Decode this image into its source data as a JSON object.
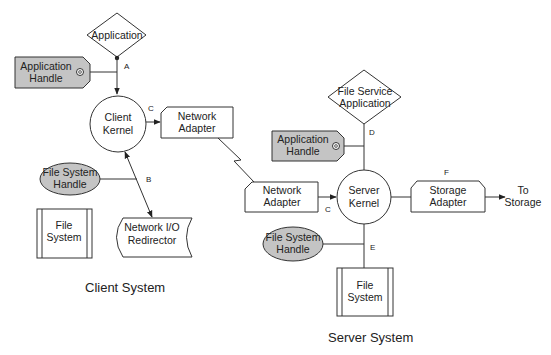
{
  "diagram": {
    "colors": {
      "line": "#333333",
      "handle_fill": "#c4c4c4",
      "background": "#ffffff"
    },
    "client": {
      "title": "Client System",
      "application": {
        "line1": "Application"
      },
      "app_handle": {
        "line1": "Application",
        "line2": "Handle"
      },
      "kernel": {
        "line1": "Client",
        "line2": "Kernel"
      },
      "network_adapter": {
        "line1": "Network",
        "line2": "Adapter"
      },
      "fs_handle": {
        "line1": "File System",
        "line2": "Handle"
      },
      "file_system": {
        "line1": "File",
        "line2": "System"
      },
      "redirector": {
        "line1": "Network I/O",
        "line2": "Redirector"
      },
      "labels": {
        "a": "A",
        "b": "B",
        "c": "C"
      }
    },
    "server": {
      "title": "Server System",
      "application": {
        "line1": "File Service",
        "line2": "Application"
      },
      "app_handle": {
        "line1": "Application",
        "line2": "Handle"
      },
      "kernel": {
        "line1": "Server",
        "line2": "Kernel"
      },
      "network_adapter": {
        "line1": "Network",
        "line2": "Adapter"
      },
      "storage_adapter": {
        "line1": "Storage",
        "line2": "Adapter"
      },
      "to_storage": {
        "line1": "To",
        "line2": "Storage"
      },
      "fs_handle": {
        "line1": "File System",
        "line2": "Handle"
      },
      "file_system": {
        "line1": "File",
        "line2": "System"
      },
      "labels": {
        "c": "C",
        "d": "D",
        "e": "E",
        "f": "F"
      }
    }
  }
}
